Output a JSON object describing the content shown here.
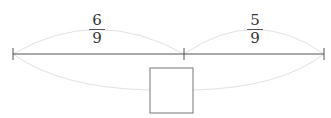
{
  "diagram": {
    "type": "number-line-fraction-sum",
    "segments": [
      {
        "label_numerator": "6",
        "label_denominator": "9"
      },
      {
        "label_numerator": "5",
        "label_denominator": "9"
      }
    ],
    "answer_box": {
      "value": ""
    },
    "colors": {
      "line": "#555555",
      "arc": "#e0e0e0",
      "box": "#777777"
    }
  }
}
